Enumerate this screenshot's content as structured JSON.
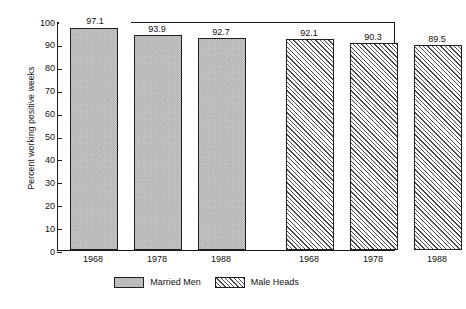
{
  "chart_data": {
    "type": "bar",
    "title": "",
    "subtitle": "",
    "xlabel": "",
    "ylabel": "Percent working positive weeks",
    "ylim": [
      0,
      100
    ],
    "yticks": [
      0,
      10,
      20,
      30,
      40,
      50,
      60,
      70,
      80,
      90,
      100
    ],
    "ytick_labels": [
      "0",
      "10",
      "20",
      "30",
      "40",
      "50",
      "60",
      "70",
      "80",
      "90",
      "100"
    ],
    "grid": false,
    "legend_position": "bottom-center",
    "categories": [
      "1968",
      "1978",
      "1988"
    ],
    "series": [
      {
        "name": "Married Men",
        "pattern": "stipple",
        "values": [
          97.1,
          93.9,
          92.7
        ],
        "value_labels": [
          "97.1",
          "93.9",
          "92.7"
        ]
      },
      {
        "name": "Male Heads",
        "pattern": "diagonal-hatch",
        "values": [
          92.1,
          90.3,
          89.5
        ],
        "value_labels": [
          "92.1",
          "90.3",
          "89.5"
        ]
      }
    ],
    "xtick_labels": [
      "1968",
      "1978",
      "1988",
      "1968",
      "1978",
      "1988"
    ],
    "colors": {
      "stipple_fill": "#c9c9c9",
      "hatch_fill": "#e4e4e4",
      "outline": "#1f1f1f",
      "axis": "#1a1a1a",
      "text": "#111111",
      "background": "#ffffff"
    }
  },
  "legend": [
    {
      "label": "Married Men",
      "pattern": "stipple"
    },
    {
      "label": "Male Heads",
      "pattern": "diagonal-hatch"
    }
  ]
}
